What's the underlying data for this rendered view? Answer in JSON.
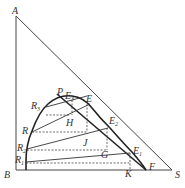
{
  "diagram": {
    "type": "ternary-phase-diagram",
    "vertices": {
      "A": "A",
      "B": "B",
      "S": "S"
    },
    "labels": {
      "A": "A",
      "B": "B",
      "S": "S",
      "P": "P",
      "E": "E",
      "E1": "E",
      "E1_sub": "1",
      "E2": "E",
      "E2_sub": "2",
      "E3": "E",
      "E3_sub": "3",
      "R": "R",
      "R1": "R",
      "R1_sub": "1",
      "R2": "R",
      "R2_sub": "2",
      "R3": "R",
      "R3_sub": "3",
      "H": "H",
      "J": "J",
      "G": "G",
      "K": "K",
      "F": "F"
    },
    "colors": {
      "line": "#333333",
      "curve": "#222222",
      "dashed": "#444444"
    }
  }
}
